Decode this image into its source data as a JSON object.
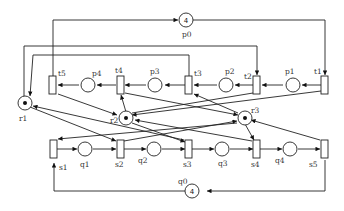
{
  "diagram": {
    "type": "petri-net",
    "places": {
      "p0": {
        "label": "p0",
        "tokens": "4"
      },
      "p1": {
        "label": "p1"
      },
      "p2": {
        "label": "p2"
      },
      "p3": {
        "label": "p3"
      },
      "p4": {
        "label": "p4"
      },
      "q0": {
        "label": "q0",
        "tokens": "4"
      },
      "q1": {
        "label": "q1"
      },
      "q2": {
        "label": "q2"
      },
      "q3": {
        "label": "q3"
      },
      "q4": {
        "label": "q4"
      },
      "r1": {
        "label": "r1",
        "tokens": 1
      },
      "r2": {
        "label": "r2",
        "tokens": 1
      },
      "r3": {
        "label": "r3",
        "tokens": 1
      }
    },
    "transitions": {
      "t1": {
        "label": "t1"
      },
      "t2": {
        "label": "t2"
      },
      "t3": {
        "label": "t3"
      },
      "t4": {
        "label": "t4"
      },
      "t5": {
        "label": "t5"
      },
      "s1": {
        "label": "s1"
      },
      "s2": {
        "label": "s2"
      },
      "s3": {
        "label": "s3"
      },
      "s4": {
        "label": "s4"
      },
      "s5": {
        "label": "s5"
      }
    }
  }
}
